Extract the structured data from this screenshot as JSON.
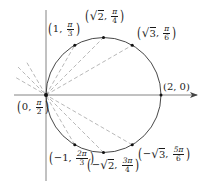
{
  "diagram": {
    "title": "",
    "type": "polar-circle r = 2cos(theta)",
    "colors": {
      "curve": "#333333",
      "axis": "#555555",
      "dashed": "#9a9a9a",
      "point": "#1a1a1a",
      "text": "#1a1a1a"
    },
    "axes": {
      "horizontal": {
        "x1": 14,
        "y": 95,
        "x2": 197,
        "arrow": true
      },
      "vertical": {
        "x": 46,
        "y1": 10,
        "y2": 181
      }
    },
    "circle": {
      "cx": 103.5,
      "cy": 95,
      "r": 57.5
    },
    "points": [
      {
        "id": "origin",
        "label_r": "0",
        "label_theta_num": "π",
        "label_theta_den": "2",
        "x": 46,
        "y": 95
      },
      {
        "id": "p1",
        "label_r": "1",
        "label_theta_num": "π",
        "label_theta_den": "3",
        "x": 74.75,
        "y": 45.2
      },
      {
        "id": "p2",
        "label_r_sqrt": "2",
        "label_theta_num": "π",
        "label_theta_den": "4",
        "x": 103.5,
        "y": 37.5
      },
      {
        "id": "p3",
        "label_r_sqrt": "3",
        "label_theta_num": "π",
        "label_theta_den": "6",
        "x": 132.25,
        "y": 45.2
      },
      {
        "id": "p4",
        "label_r": "2",
        "label_theta": "0",
        "x": 161,
        "y": 95
      },
      {
        "id": "p5",
        "label_r": "−1",
        "label_theta_num": "2π",
        "label_theta_den": "3",
        "x": 74.75,
        "y": 144.8
      },
      {
        "id": "p6",
        "label_r_sqrt": "2",
        "label_r_sign": "−",
        "label_theta_num": "3π",
        "label_theta_den": "4",
        "x": 103.5,
        "y": 152.5
      },
      {
        "id": "p7",
        "label_r_sqrt": "3",
        "label_r_sign": "−",
        "label_theta_num": "5π",
        "label_theta_den": "6",
        "x": 132.25,
        "y": 144.8
      }
    ],
    "dashed_lines": [
      {
        "from": "origin",
        "x2": 74.75,
        "y2": 45.2
      },
      {
        "from": "origin",
        "x2": 103.5,
        "y2": 37.5
      },
      {
        "from": "origin",
        "x2": 132.25,
        "y2": 45.2
      },
      {
        "from": "p5",
        "x1": 74.75,
        "y1": 144.8,
        "x2": 26,
        "y2": 61
      },
      {
        "from": "p6",
        "x1": 103.5,
        "y1": 152.5,
        "x2": 18,
        "y2": 67
      },
      {
        "from": "p7",
        "x1": 132.25,
        "y1": 144.8,
        "x2": 14,
        "y2": 76.5
      }
    ],
    "labels": {
      "origin": {
        "r": "0",
        "num": "π",
        "den": "2"
      },
      "p1": {
        "r": "1",
        "num": "π",
        "den": "3"
      },
      "p2": {
        "sign": "",
        "sqrt": "2",
        "num": "π",
        "den": "4"
      },
      "p3": {
        "sign": "",
        "sqrt": "3",
        "num": "π",
        "den": "6"
      },
      "p4": {
        "text": "(2, 0)"
      },
      "p5": {
        "r": "−1",
        "num": "2π",
        "den": "3"
      },
      "p6": {
        "sign": "−",
        "sqrt": "2",
        "num": "3π",
        "den": "4"
      },
      "p7": {
        "sign": "−",
        "sqrt": "3",
        "num": "5π",
        "den": "6"
      }
    },
    "comma": ","
  }
}
